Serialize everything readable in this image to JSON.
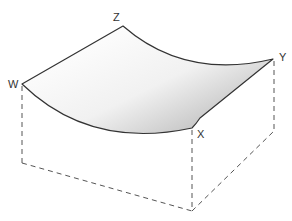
{
  "diagram": {
    "type": "3d-surface-over-box",
    "labels": {
      "w": "W",
      "z": "Z",
      "y": "Y",
      "x": "X"
    },
    "colors": {
      "edge": "#333333",
      "dashed": "#555555",
      "surface_light": "#ffffff",
      "surface_dark": "#bdbdbd",
      "label": "#333333"
    }
  }
}
